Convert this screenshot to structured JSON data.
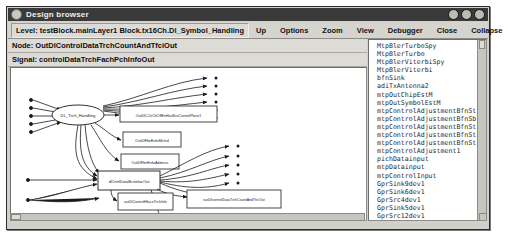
{
  "window": {
    "title": "Design browser",
    "title_buttons": [
      "minimize-button",
      "maximize-button",
      "close-button"
    ]
  },
  "toolbar": {
    "level_label": "Level: testBlock.mainLayer1 Block.tx16Ch.Dl_Symbol_Handling",
    "up_label": "Up",
    "options_label": "Options",
    "zoom_label": "Zoom",
    "view_label": "View",
    "debugger_label": "Debugger",
    "close_label": "Close",
    "collapse_label": "Collapse"
  },
  "info": {
    "node_label": "Node: OutDlControlDataTrchCountAndTfciOut",
    "signal_label": "Signal: controlDataTrchFachPchInfoOut"
  },
  "graph": {
    "ellipse_label": "DL_Trch_Handling",
    "boxes": [
      {
        "label": "OutDlCCtrChOffEnHacBceControlPlane1"
      },
      {
        "label": "OutDlFbnEnfoMcInd"
      },
      {
        "label": "OutDlFbnEnfoAddress"
      },
      {
        "label": "dlCntrlDataBcstnfacOut"
      },
      {
        "label": "outDlControlHfaceTrchInfo"
      },
      {
        "label": "outDlcontrolDataTrchCountAndTfciOut"
      }
    ]
  },
  "list": {
    "items": [
      {
        "label": "MtpBlerTurboSpy",
        "expandable": false
      },
      {
        "label": "MtpBlerTurbo",
        "expandable": false
      },
      {
        "label": "MtpBlerViterbiSpy",
        "expandable": false
      },
      {
        "label": "MtpBlerViterbi",
        "expandable": false
      },
      {
        "label": "bfnSink",
        "expandable": false
      },
      {
        "label": "adiTxAntenna2",
        "expandable": false
      },
      {
        "label": "mtpOutChipEstM",
        "expandable": false
      },
      {
        "label": "mtpOutSymbolEstM",
        "expandable": false
      },
      {
        "label": "mtpControlAdjustmentBfnSt",
        "expandable": false
      },
      {
        "label": "mtpControlAdjustmentBfnSb",
        "expandable": false
      },
      {
        "label": "mtpControlAdjustmentBfnSt",
        "expandable": false
      },
      {
        "label": "mtpControlAdjustmentBfnSt",
        "expandable": false
      },
      {
        "label": "mtpControlAdjustmentBfnSt",
        "expandable": false
      },
      {
        "label": "mtpControlAdjustment1",
        "expandable": false
      },
      {
        "label": "pichDatainput",
        "expandable": false
      },
      {
        "label": "mtpDatainput",
        "expandable": false
      },
      {
        "label": "mtpControlInput",
        "expandable": false
      },
      {
        "label": "GprSink9dev1",
        "expandable": false
      },
      {
        "label": "GprSink6dev1",
        "expandable": false
      },
      {
        "label": "GprSrc4dev1",
        "expandable": false
      },
      {
        "label": "GprSink5dev1",
        "expandable": false
      },
      {
        "label": "GprSrc12dev1",
        "expandable": false
      },
      {
        "label": "adiRxAntenna1",
        "expandable": false
      },
      {
        "label": "adiTxAntenna1",
        "expandable": false
      },
      {
        "label": "MtpiubMeasureViterbi",
        "expandable": true
      }
    ]
  },
  "colors": {
    "titlebar": "#3a3a3a",
    "chrome": "#d2d0cb",
    "field": "#dddbd6",
    "canvas": "#ffffff",
    "line": "#1a1a1a"
  }
}
